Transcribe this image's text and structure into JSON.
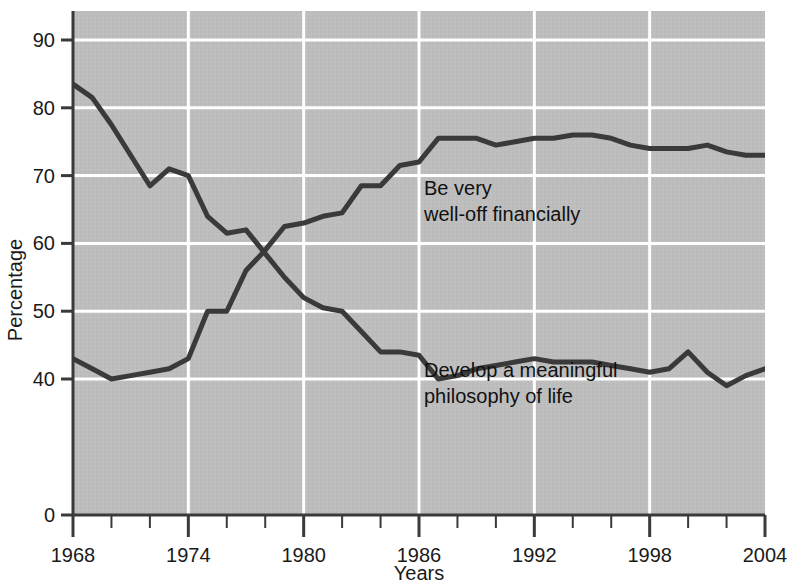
{
  "chart_data": {
    "type": "line",
    "title": "",
    "xlabel": "Years",
    "ylabel": "Percentage",
    "xlim": [
      1968,
      2004
    ],
    "ylim": [
      40,
      95
    ],
    "y_axis_break": true,
    "y_axis_break_note": "Axis broken between 0 and 40",
    "grid": true,
    "grid_color": "#ffffff",
    "plot_background": "#bdbdbd",
    "line_color": "#3a3a3a",
    "legend_position": "inline-annotation",
    "x_major_ticks": [
      1968,
      1974,
      1980,
      1986,
      1992,
      1998,
      2004
    ],
    "x_minor_tick_step": 2,
    "y_ticks": [
      0,
      40,
      50,
      60,
      70,
      80,
      90
    ],
    "y_tick_labels": [
      "0",
      "40",
      "50",
      "60",
      "70",
      "80",
      "90"
    ],
    "x": [
      1968,
      1969,
      1970,
      1971,
      1972,
      1973,
      1974,
      1975,
      1976,
      1977,
      1978,
      1979,
      1980,
      1981,
      1982,
      1983,
      1984,
      1985,
      1986,
      1987,
      1988,
      1989,
      1990,
      1991,
      1992,
      1993,
      1994,
      1995,
      1996,
      1997,
      1998,
      1999,
      2000,
      2001,
      2002,
      2003,
      2004
    ],
    "series": [
      {
        "name": "Be very well-off financially",
        "label_line1": "Be very",
        "label_line2": "well-off financially",
        "label_x": 1986,
        "label_y": 70,
        "values": [
          43,
          41.5,
          40,
          40.5,
          41,
          41.5,
          43,
          50,
          50,
          56,
          59,
          62.5,
          63,
          64,
          64.5,
          68.5,
          68.5,
          71.5,
          72,
          75.5,
          75.5,
          75.5,
          74.5,
          75,
          75.5,
          75.5,
          76,
          76,
          75.5,
          74.5,
          74,
          74,
          74,
          74.5,
          73.5,
          73,
          73
        ]
      },
      {
        "name": "Develop a meaningful philosophy of life",
        "label_line1": "Develop a meaningful",
        "label_line2": "philosophy of life",
        "label_x": 1986,
        "label_y": 50,
        "values": [
          83.5,
          81.5,
          77.5,
          73,
          68.5,
          71,
          70,
          64,
          61.5,
          62,
          58.5,
          55,
          52,
          50.5,
          50,
          47,
          44,
          44,
          43.5,
          40,
          40.5,
          41.5,
          42,
          42.5,
          43,
          42.5,
          42.5,
          42.5,
          42,
          41.5,
          41,
          41.5,
          44,
          41,
          39,
          40.5,
          41.5
        ]
      }
    ]
  },
  "axes": {
    "x_title": "Years",
    "y_title": "Percentage"
  }
}
